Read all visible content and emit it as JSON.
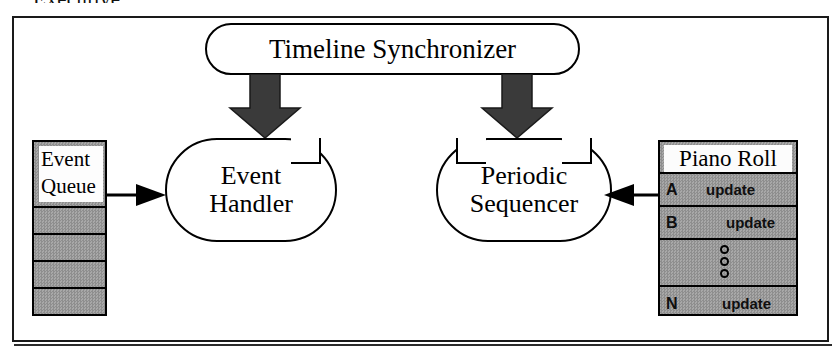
{
  "caption": {
    "text": "Executive"
  },
  "diagram": {
    "nodes": {
      "timeline_synchronizer": {
        "label": "Timeline Synchronizer",
        "shape": "stadium"
      },
      "event_handler": {
        "label_line1": "Event",
        "label_line2": "Handler",
        "shape": "rounded-notched"
      },
      "periodic_sequencer": {
        "label_line1": "Periodic",
        "label_line2": "Sequencer",
        "shape": "rounded-notched"
      }
    },
    "event_queue": {
      "label_line1": "Event",
      "label_line2": "Queue",
      "empty_slots": 4
    },
    "piano_roll": {
      "title": "Piano Roll",
      "rows": [
        {
          "key": "A",
          "action": "update"
        },
        {
          "key": "B",
          "action": "update"
        },
        {
          "key": "",
          "action": ""
        },
        {
          "key": "N",
          "action": "update"
        }
      ],
      "ellipsis_dots": 3
    },
    "arrows": [
      {
        "name": "timeline-to-event-handler",
        "style": "block",
        "direction": "down"
      },
      {
        "name": "timeline-to-periodic-sequencer",
        "style": "block",
        "direction": "down"
      },
      {
        "name": "event-queue-to-event-handler",
        "style": "line",
        "direction": "right"
      },
      {
        "name": "piano-roll-to-periodic-sequencer",
        "style": "line",
        "direction": "left"
      }
    ],
    "colors": {
      "stroke": "#000000",
      "fill_white": "#ffffff",
      "fill_gray": "#9c9c9c",
      "frame": "#1a1a1a"
    }
  }
}
